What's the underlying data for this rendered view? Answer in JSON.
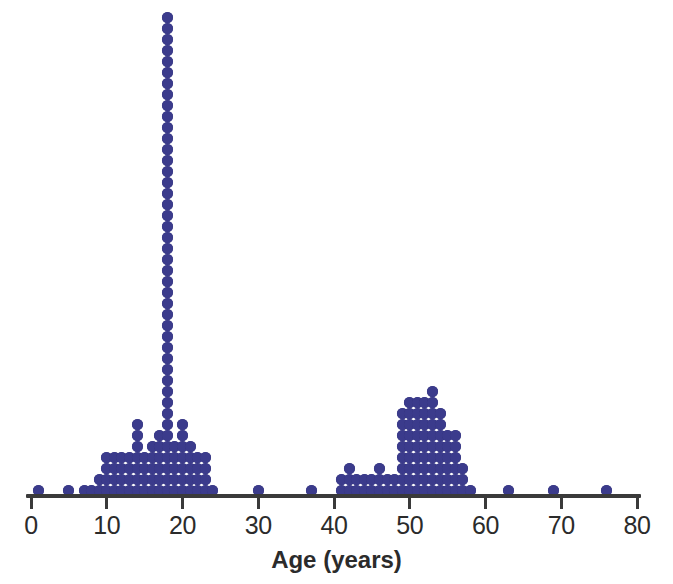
{
  "chart_data": {
    "type": "dotplot",
    "title": "",
    "subtitle": "",
    "xlabel": "Age (years)",
    "ylabel": "",
    "xlim": [
      0,
      80
    ],
    "ylim": [
      0,
      44
    ],
    "grid": false,
    "legend": null,
    "dot_color": "#3b3b8c",
    "axis_color": "#3a3a3a",
    "background_color": "#ffffff",
    "xticks": [
      0,
      10,
      20,
      30,
      40,
      50,
      60,
      70,
      80
    ],
    "xtick_labels": [
      "0",
      "10",
      "20",
      "30",
      "40",
      "50",
      "60",
      "70",
      "80"
    ],
    "x_minor_step": 1,
    "dot_unit": 1,
    "total_count": 312,
    "categories": [
      1,
      5,
      7,
      8,
      9,
      10,
      11,
      12,
      13,
      14,
      15,
      16,
      17,
      18,
      19,
      20,
      21,
      22,
      23,
      24,
      30,
      37,
      41,
      42,
      43,
      44,
      45,
      46,
      47,
      48,
      49,
      50,
      51,
      52,
      53,
      54,
      55,
      56,
      57,
      58,
      63,
      69,
      76
    ],
    "values": [
      1,
      1,
      1,
      1,
      2,
      4,
      4,
      4,
      4,
      7,
      4,
      5,
      6,
      44,
      5,
      7,
      5,
      4,
      4,
      1,
      1,
      1,
      2,
      3,
      2,
      2,
      2,
      3,
      2,
      2,
      8,
      9,
      9,
      9,
      10,
      8,
      6,
      6,
      3,
      1,
      1,
      1,
      1
    ],
    "annotations": [
      {
        "text": "tall mode column at age 18",
        "x": 18,
        "y": 44
      },
      {
        "text": "secondary mode near ages 49-54",
        "x": 53,
        "y": 10
      }
    ],
    "clusters": [
      {
        "name": "younger-cluster",
        "range": [
          1,
          24
        ],
        "peak_age": 18,
        "peak_count": 44
      },
      {
        "name": "sparse-middle",
        "range": [
          30,
          37
        ],
        "peak_age": 30,
        "peak_count": 1
      },
      {
        "name": "older-cluster",
        "range": [
          41,
          58
        ],
        "peak_age": 53,
        "peak_count": 10
      },
      {
        "name": "outliers-right",
        "range": [
          63,
          76
        ],
        "peak_age": 63,
        "peak_count": 1
      }
    ]
  },
  "axis": {
    "title": "Age (years)"
  }
}
